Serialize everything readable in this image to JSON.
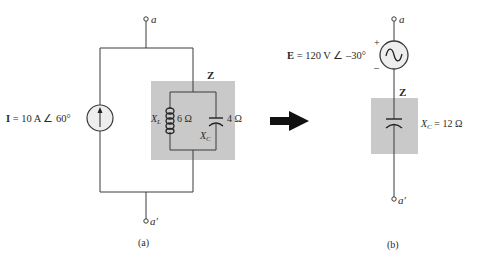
{
  "colors": {
    "wire": "#3a3a3a",
    "box": "#c9c9c9",
    "source_fill": "#eeeeee",
    "arrow": "#111111"
  },
  "circuit_a": {
    "terminal_top": "a",
    "terminal_bottom": "a′",
    "source_label": "I = 10 A ∠ 60°",
    "source_symbol": "I",
    "source_rest": " = 10 A ∠ 60°",
    "impedance_label": "Z",
    "inductor_label": "X",
    "inductor_sub": "L",
    "inductor_value": "6 Ω",
    "capacitor_label": "X",
    "capacitor_sub": "C",
    "capacitor_value": "4 Ω",
    "caption": "(a)"
  },
  "circuit_b": {
    "terminal_top": "a",
    "terminal_bottom": "a′",
    "source_symbol": "E",
    "source_rest": " = 120 V ∠ –30°",
    "plus": "+",
    "minus": "–",
    "impedance_label": "Z",
    "capacitor_label": "X",
    "capacitor_sub": "C",
    "capacitor_value": " = 12 Ω",
    "caption": "(b)"
  }
}
